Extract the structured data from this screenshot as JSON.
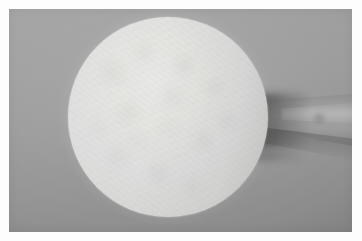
{
  "image": {
    "medium": "photograph",
    "color_mode": "grayscale",
    "width": 362,
    "height": 241,
    "has_white_paper_border": true,
    "border_width_px": 9,
    "description": "Close-up grayscale photograph of a large pale circular disc on a gray studio background, with a forearm entering from the right edge and partially hidden behind the disc."
  },
  "palette": {
    "paper_border": "#fdfdfd",
    "background_light": "#a4a4a4",
    "background_mid": "#9b9b9b",
    "background_dark": "#898989",
    "disc_highlight": "#e8e8e6",
    "disc_mid": "#dedede",
    "disc_edge": "#c8c8c6",
    "limb_light": "#a2a2a2",
    "limb_mid": "#9a9a9a",
    "limb_dark": "#7d7d7d",
    "cast_shadow": "#6e6e6e"
  },
  "subjects": {
    "disc": {
      "name": "pale-circular-disc",
      "shape": "circle",
      "center_x": 159,
      "center_y": 117,
      "diameter_px": 200,
      "fill": "#dedede",
      "surface": "matte mottled fibrous texture",
      "edge": "soft, slightly out of focus"
    },
    "limb": {
      "name": "forearm",
      "enters_from": "right edge",
      "top_y": 92,
      "bottom_y": 150,
      "tapers_toward": "left",
      "occluded_by": "pale-circular-disc"
    },
    "shadow": {
      "name": "cast-shadow",
      "position": "right of disc, under limb",
      "direction": "rightward and downward",
      "softness": "soft-edged"
    },
    "background": {
      "name": "studio-seamless-backdrop",
      "tone": "neutral gray",
      "gradient": "lighter at upper-left, darker toward lower-right"
    }
  }
}
